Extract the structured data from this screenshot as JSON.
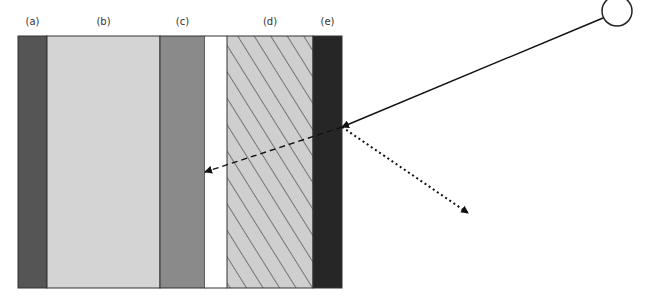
{
  "diagram": {
    "type": "layered-wall-light-path",
    "layers": [
      {
        "id": "a",
        "label": "(a)",
        "x0": 18,
        "x1": 47,
        "fill": "#555555",
        "pattern": "solid"
      },
      {
        "id": "b",
        "label": "(b)",
        "x0": 47,
        "x1": 160,
        "fill": "#d4d4d4",
        "pattern": "solid"
      },
      {
        "id": "c",
        "label": "(c)",
        "x0": 160,
        "x1": 205,
        "fill": "#8a8a8a",
        "pattern": "solid"
      },
      {
        "id": "gap",
        "label": "",
        "x0": 205,
        "x1": 227,
        "fill": "#ffffff",
        "pattern": "none"
      },
      {
        "id": "d",
        "label": "(d)",
        "x0": 227,
        "x1": 313,
        "fill": "#cfcfcf",
        "pattern": "diagonal-hatch"
      },
      {
        "id": "e",
        "label": "(e)",
        "x0": 313,
        "x1": 342,
        "fill": "#262626",
        "pattern": "solid"
      }
    ],
    "top": 36,
    "bottom": 288,
    "source": {
      "shape": "circle",
      "cx": 617,
      "cy": 11,
      "r": 15
    },
    "rays": [
      {
        "name": "incident-ray",
        "style": "solid",
        "from": [
          603,
          18
        ],
        "to": [
          342,
          127
        ]
      },
      {
        "name": "transmitted-ray",
        "style": "dashed",
        "from": [
          342,
          127
        ],
        "to": [
          205,
          172
        ]
      },
      {
        "name": "reflected-ray",
        "style": "dotted",
        "from": [
          342,
          127
        ],
        "to": [
          468,
          213
        ]
      }
    ]
  }
}
